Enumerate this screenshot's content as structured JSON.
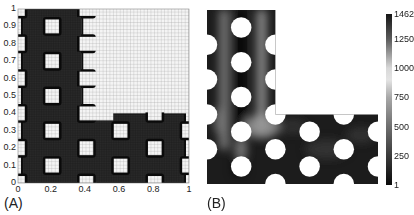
{
  "panels": {
    "a": {
      "label": "(A)"
    },
    "b": {
      "label": "(B)"
    }
  },
  "chart_data": [
    {
      "type": "heatmap",
      "title": "(A)",
      "description": "Finite element mesh of L-shaped perforated domain; dark = material (meshed), light = void",
      "xlabel": "",
      "ylabel": "",
      "xlim": [
        0,
        1
      ],
      "ylim": [
        0,
        1
      ],
      "x_ticks": [
        "0",
        "0.2",
        "0.4",
        "0.6",
        "0.8",
        "1"
      ],
      "y_ticks": [
        "0",
        "0.1",
        "0.2",
        "0.3",
        "0.4",
        "0.5",
        "0.6",
        "0.7",
        "0.8",
        "0.9",
        "1"
      ],
      "grid": true,
      "material_regions": [
        {
          "x0": 0.0,
          "y0": 0.0,
          "x1": 0.4,
          "y1": 1.0
        },
        {
          "x0": 0.4,
          "y0": 0.0,
          "x1": 1.0,
          "y1": 0.4
        }
      ],
      "holes": [
        [
          0.2,
          0.9
        ],
        [
          0.2,
          0.7
        ],
        [
          0.2,
          0.5
        ],
        [
          0.2,
          0.3
        ],
        [
          0.2,
          0.1
        ],
        [
          0.4,
          0.2
        ],
        [
          0.6,
          0.3
        ],
        [
          0.6,
          0.1
        ],
        [
          0.8,
          0.2
        ],
        [
          0.0,
          0.8
        ],
        [
          0.0,
          0.6
        ],
        [
          0.0,
          0.4
        ],
        [
          0.0,
          0.2
        ],
        [
          0.0,
          0.0
        ],
        [
          0.0,
          1.0
        ],
        [
          0.4,
          1.0
        ],
        [
          0.4,
          0.8
        ],
        [
          0.4,
          0.6
        ],
        [
          0.4,
          0.4
        ],
        [
          0.4,
          0.0
        ],
        [
          0.8,
          0.4
        ],
        [
          0.8,
          0.0
        ],
        [
          1.0,
          0.3
        ],
        [
          1.0,
          0.1
        ]
      ],
      "hole_size": 0.08
    },
    {
      "type": "heatmap",
      "title": "(B)",
      "description": "Scalar field on L-shaped perforated domain with circular holes",
      "colorbar": {
        "min": 1,
        "max": 1462,
        "ticks": [
          "1462",
          "1250",
          "1000",
          "750",
          "500",
          "250",
          "1"
        ],
        "tick_values": [
          1462,
          1250,
          1000,
          750,
          500,
          250,
          1
        ],
        "colormap_stops": [
          {
            "value": 1462,
            "color": "#151515"
          },
          {
            "value": 1250,
            "color": "#5a5a5a"
          },
          {
            "value": 1000,
            "color": "#d8d8d8"
          },
          {
            "value": 900,
            "color": "#e4e4e4"
          },
          {
            "value": 750,
            "color": "#a8a8a8"
          },
          {
            "value": 500,
            "color": "#6e6e6e"
          },
          {
            "value": 250,
            "color": "#3a3a3a"
          },
          {
            "value": 1,
            "color": "#0a0a0a"
          }
        ]
      },
      "holes": [
        [
          0.2,
          0.9
        ],
        [
          0.2,
          0.7
        ],
        [
          0.2,
          0.5
        ],
        [
          0.2,
          0.3
        ],
        [
          0.2,
          0.1
        ],
        [
          0.4,
          0.2
        ],
        [
          0.6,
          0.3
        ],
        [
          0.6,
          0.1
        ],
        [
          0.8,
          0.2
        ],
        [
          0.0,
          0.8
        ],
        [
          0.0,
          0.6
        ],
        [
          0.0,
          0.4
        ],
        [
          0.0,
          0.2
        ],
        [
          0.4,
          0.8
        ],
        [
          0.4,
          0.6
        ],
        [
          0.4,
          0.4
        ],
        [
          0.4,
          0.0
        ],
        [
          0.8,
          0.4
        ],
        [
          0.8,
          0.0
        ],
        [
          1.0,
          0.3
        ],
        [
          1.0,
          0.1
        ]
      ],
      "hole_radius": 0.06
    }
  ]
}
